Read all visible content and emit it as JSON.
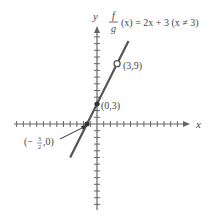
{
  "chart_data": {
    "type": "line",
    "function": "2x + 3",
    "restriction": "x ≠ 3",
    "xlabel": "x",
    "ylabel": "y",
    "xlim": [
      -12.5,
      13.5
    ],
    "ylim": [
      -13,
      14
    ],
    "grid": false,
    "tick_step": 1,
    "segment": {
      "x_start": -4,
      "y_start": -5,
      "x_end": 4.7,
      "y_end": 12.4
    },
    "points": [
      {
        "label": "(3,9)",
        "x": 3,
        "y": 9,
        "style": "open"
      },
      {
        "label": "(0,3)",
        "x": 0,
        "y": 3,
        "style": "filled"
      },
      {
        "label": "(−3/2,0)",
        "x": -1.5,
        "y": 0,
        "style": "filled"
      }
    ],
    "colors": {
      "line": "#555555",
      "axis": "#666666",
      "text": "#444444"
    }
  },
  "labels": {
    "func_num": "f",
    "func_den": "g",
    "func_rest": "(x) = 2x + 3 (x ≠ 3)",
    "x_axis": "x",
    "y_axis": "y",
    "p39": "(3,9)",
    "p03": "(0,3)",
    "pneg_pre": "(−",
    "pneg_num": "3",
    "pneg_den": "2",
    "pneg_post": ",0)"
  }
}
